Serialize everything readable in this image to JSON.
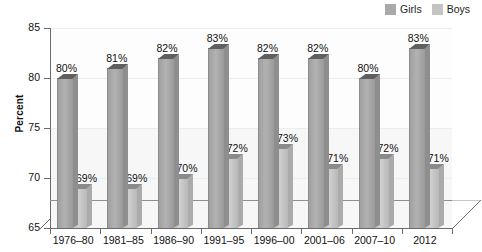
{
  "chart_data": {
    "type": "bar",
    "title": "",
    "subtitle": "",
    "xlabel": "",
    "ylabel": "Percent",
    "ylim": [
      65,
      85
    ],
    "yticks": [
      65,
      70,
      75,
      80,
      85
    ],
    "grid": true,
    "legend_position": "top-right",
    "style": "3d-clustered-bar",
    "categories": [
      "1976–80",
      "1981–85",
      "1986–90",
      "1991–95",
      "1996–00",
      "2001–06",
      "2007–10",
      "2012"
    ],
    "series": [
      {
        "name": "Girls",
        "color": "#a9a9a9",
        "values": [
          80,
          81,
          82,
          83,
          82,
          82,
          80,
          83
        ],
        "labels": [
          "80%",
          "81%",
          "82%",
          "83%",
          "82%",
          "82%",
          "80%",
          "83%"
        ]
      },
      {
        "name": "Boys",
        "color": "#c4c4c4",
        "values": [
          69,
          69,
          70,
          72,
          73,
          71,
          72,
          71
        ],
        "labels": [
          "69%",
          "69%",
          "70%",
          "72%",
          "73%",
          "71%",
          "72%",
          "71%"
        ]
      }
    ]
  },
  "legend": {
    "items": [
      {
        "label": "Girls",
        "color": "#a9a9a9"
      },
      {
        "label": "Boys",
        "color": "#c4c4c4"
      }
    ]
  },
  "axes": {
    "y": {
      "label": "Percent",
      "tick_labels": [
        "85",
        "80",
        "75",
        "70",
        "65"
      ]
    },
    "x": {
      "tick_labels": [
        "1976–80",
        "1981–85",
        "1986–90",
        "1991–95",
        "1996–00",
        "2001–06",
        "2007–10",
        "2012"
      ]
    }
  }
}
